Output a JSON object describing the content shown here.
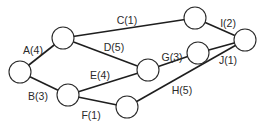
{
  "diagram": {
    "type": "network",
    "nodes": [
      {
        "id": "n0",
        "x": 20,
        "y": 72,
        "r": 11
      },
      {
        "id": "n1",
        "x": 63,
        "y": 38,
        "r": 11
      },
      {
        "id": "n2",
        "x": 68,
        "y": 95,
        "r": 11
      },
      {
        "id": "n3",
        "x": 148,
        "y": 70,
        "r": 11
      },
      {
        "id": "n4",
        "x": 127,
        "y": 107,
        "r": 11
      },
      {
        "id": "n5",
        "x": 195,
        "y": 18,
        "r": 11
      },
      {
        "id": "n6",
        "x": 198,
        "y": 53,
        "r": 11
      },
      {
        "id": "n7",
        "x": 245,
        "y": 40,
        "r": 11
      }
    ],
    "edges": [
      {
        "id": "A",
        "label": "A(4)",
        "activity": "A",
        "duration": 4,
        "from": "n0",
        "to": "n1",
        "lx": 33,
        "ly": 50
      },
      {
        "id": "B",
        "label": "B(3)",
        "activity": "B",
        "duration": 3,
        "from": "n0",
        "to": "n2",
        "lx": 38,
        "ly": 96
      },
      {
        "id": "C",
        "label": "C(1)",
        "activity": "C",
        "duration": 1,
        "from": "n1",
        "to": "n5",
        "lx": 127,
        "ly": 20
      },
      {
        "id": "D",
        "label": "D(5)",
        "activity": "D",
        "duration": 5,
        "from": "n1",
        "to": "n3",
        "lx": 114,
        "ly": 47
      },
      {
        "id": "E",
        "label": "E(4)",
        "activity": "E",
        "duration": 4,
        "from": "n2",
        "to": "n3",
        "lx": 100,
        "ly": 75
      },
      {
        "id": "F",
        "label": "F(1)",
        "activity": "F",
        "duration": 1,
        "from": "n2",
        "to": "n4",
        "lx": 91,
        "ly": 115
      },
      {
        "id": "G",
        "label": "G(3)",
        "activity": "G",
        "duration": 3,
        "from": "n3",
        "to": "n6",
        "lx": 172,
        "ly": 57
      },
      {
        "id": "H",
        "label": "H(5)",
        "activity": "H",
        "duration": 5,
        "from": "n4",
        "to": "n7",
        "lx": 182,
        "ly": 90
      },
      {
        "id": "I",
        "label": "I(2)",
        "activity": "I",
        "duration": 2,
        "from": "n5",
        "to": "n7",
        "lx": 228,
        "ly": 23
      },
      {
        "id": "J",
        "label": "J(1)",
        "activity": "J",
        "duration": 1,
        "from": "n6",
        "to": "n7",
        "lx": 228,
        "ly": 60
      }
    ]
  },
  "colors": {
    "line": "#1e1e1e",
    "node_stroke": "#2a2a2a",
    "text": "#2a2a2a",
    "background": "#ffffff"
  }
}
